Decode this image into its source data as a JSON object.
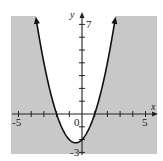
{
  "chart_data": {
    "type": "line",
    "title": "",
    "subtitle": "",
    "xlabel": "x",
    "ylabel": "y",
    "xlim": [
      -5,
      5
    ],
    "ylim": [
      -3,
      7
    ],
    "grid": false,
    "x_ticks": [
      -5,
      -4,
      -3,
      -2,
      -1,
      0,
      1,
      2,
      3,
      4,
      5
    ],
    "y_ticks": [
      -3,
      -2,
      -1,
      0,
      1,
      2,
      3,
      4,
      5,
      6,
      7
    ],
    "x_tick_labels_shown": [
      "-5",
      "0",
      "5"
    ],
    "y_tick_labels_shown": [
      "7",
      "-3"
    ],
    "series": [
      {
        "name": "parabola",
        "equation": "y = x^2 + x - 2",
        "boundary_style": "solid",
        "arrows": "both-ends",
        "x": [
          -3.6,
          -3,
          -2.5,
          -2,
          -1.5,
          -1,
          -0.5,
          0,
          0.5,
          1,
          1.5,
          2,
          2.6
        ],
        "values": [
          7.36,
          4,
          1.75,
          0,
          -1.25,
          -2,
          -2.25,
          -2,
          -1.25,
          0,
          1.75,
          4,
          7.36
        ]
      }
    ],
    "shading": {
      "region": "outside the parabola (below/right/left of curve)",
      "inequality": "y <= x^2 + x - 2",
      "color": "#c8c8c8"
    },
    "key_points": {
      "vertex": [
        -0.5,
        -2.25
      ],
      "x_intercepts": [
        -2,
        1
      ],
      "y_intercept": -2
    }
  },
  "labels": {
    "x_axis": "x",
    "y_axis": "y",
    "x_min": "-5",
    "x_max": "5",
    "origin": "0",
    "y_max": "7",
    "y_min": "-3"
  },
  "colors": {
    "shade": "#c8c8c8",
    "curve": "#111111",
    "axis": "#222222",
    "background": "#ffffff"
  }
}
